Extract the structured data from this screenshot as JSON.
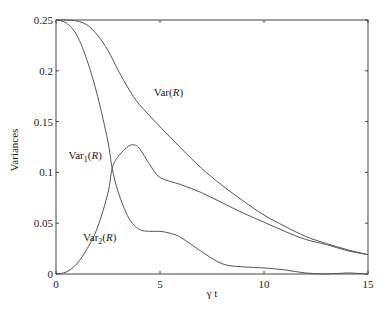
{
  "chart_data": {
    "type": "line",
    "title": "",
    "xlabel": "γ t",
    "ylabel": "Variances",
    "xlim": [
      0,
      15
    ],
    "ylim": [
      0,
      0.25
    ],
    "xticks": [
      "0",
      "5",
      "10",
      "15"
    ],
    "yticks": [
      "0",
      "0.05",
      "0.1",
      "0.15",
      "0.2",
      "0.25"
    ],
    "grid": false,
    "legend": "inline annotations",
    "annotations": [
      {
        "text": "Var(R)",
        "x": 4.7,
        "y": 0.175
      },
      {
        "text": "Var1(R)",
        "x": 0.6,
        "y": 0.113
      },
      {
        "text": "Var2(R)",
        "x": 1.3,
        "y": 0.032
      }
    ],
    "series": [
      {
        "name": "Var(R)",
        "x": [
          0,
          0.5,
          1,
          1.5,
          2,
          2.5,
          3,
          3.5,
          4,
          5,
          6,
          7,
          8,
          9,
          10,
          11,
          12,
          13,
          14,
          15
        ],
        "y": [
          0.25,
          0.25,
          0.249,
          0.245,
          0.235,
          0.22,
          0.2,
          0.182,
          0.167,
          0.145,
          0.124,
          0.104,
          0.087,
          0.072,
          0.058,
          0.047,
          0.037,
          0.03,
          0.024,
          0.019
        ]
      },
      {
        "name": "Var1(R)",
        "x": [
          0,
          0.5,
          1,
          1.5,
          2,
          2.5,
          2.7,
          3,
          3.5,
          4,
          4.5,
          5,
          5.5,
          6,
          7,
          8,
          9,
          10,
          11,
          12,
          13,
          14,
          15
        ],
        "y": [
          0.25,
          0.247,
          0.235,
          0.21,
          0.175,
          0.13,
          0.104,
          0.08,
          0.055,
          0.044,
          0.042,
          0.042,
          0.04,
          0.036,
          0.022,
          0.01,
          0.007,
          0.006,
          0.004,
          0.001,
          0.0,
          0.001,
          0.0
        ]
      },
      {
        "name": "Var2(R)",
        "x": [
          0,
          0.5,
          1,
          1.5,
          2,
          2.5,
          2.7,
          3,
          3.5,
          3.75,
          4,
          4.5,
          5,
          6,
          7,
          8,
          9,
          10,
          11,
          12,
          13,
          14,
          15
        ],
        "y": [
          0,
          0.002,
          0.01,
          0.025,
          0.046,
          0.08,
          0.104,
          0.116,
          0.126,
          0.127,
          0.124,
          0.108,
          0.095,
          0.088,
          0.08,
          0.07,
          0.06,
          0.051,
          0.042,
          0.034,
          0.029,
          0.023,
          0.019
        ]
      }
    ]
  }
}
